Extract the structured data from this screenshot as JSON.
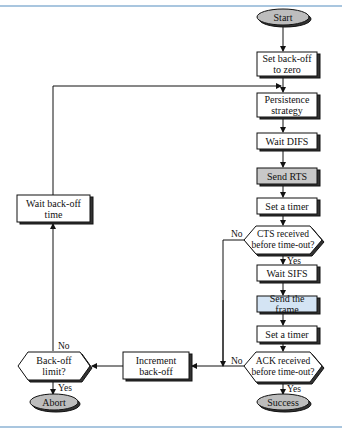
{
  "flowchart": {
    "colors": {
      "border_rule": "#a9c6df",
      "terminal_fill": "#bdbdbd",
      "send_rts_fill": "#c8c8c8",
      "send_frame_fill": "#d4e4f4",
      "box_fill": "#ffffff",
      "stroke": "#111111"
    },
    "nodes": {
      "start": "Start",
      "set_backoff_zero": "Set back-off to zero",
      "persistence": "Persistence strategy",
      "wait_difs": "Wait DIFS",
      "send_rts": "Send RTS",
      "set_timer_1": "Set a timer",
      "cts_decision": "CTS received before time-out?",
      "wait_sifs": "Wait SIFS",
      "send_frame": "Send the frame",
      "set_timer_2": "Set a timer",
      "ack_decision": "ACK received before time-out?",
      "success": "Success",
      "wait_backoff_time": "Wait back-off time",
      "increment_backoff": "Increment back-off",
      "backoff_limit": "Back-off limit?",
      "abort": "Abort"
    },
    "edge_labels": {
      "cts_no": "No",
      "cts_yes": "Yes",
      "ack_no": "No",
      "ack_yes": "Yes",
      "limit_no": "No",
      "limit_yes": "Yes"
    }
  }
}
